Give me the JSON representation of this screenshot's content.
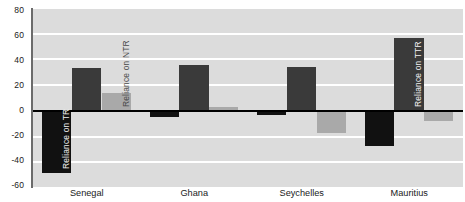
{
  "chart_data": {
    "type": "bar",
    "title": "",
    "subtitle": "",
    "xlabel": "",
    "ylabel": "",
    "categories": [
      "Senegal",
      "Ghana",
      "Seychelles",
      "Mauritius"
    ],
    "series": [
      {
        "name": "Reliance on TR",
        "color": "#111111",
        "values": [
          -48,
          -5,
          -3,
          -27
        ]
      },
      {
        "name": "Reliance on NTR",
        "color": "#3a3a3a",
        "values": [
          33,
          36,
          34,
          57
        ]
      },
      {
        "name": "Reliance on TTR",
        "color": "#a9a9a9",
        "values": [
          14,
          3,
          -17,
          -8
        ]
      }
    ],
    "ylim": [
      -60,
      80
    ],
    "yticks": [
      80,
      60,
      40,
      20,
      0,
      -20,
      -40,
      -60
    ],
    "ytick_labels": [
      "80",
      "60",
      "40",
      "20",
      "0",
      "-20",
      "-40",
      "-60"
    ],
    "grid": true,
    "grid_color": "#ffffff",
    "plot_background": "#dcdcdc",
    "zero_line_color": "#000000",
    "legend": "none",
    "annotations": [
      {
        "text": "Reliance on TR",
        "category": "Senegal",
        "series": "Reliance on TR",
        "color": "#f2f2f2"
      },
      {
        "text": "Reliance on NTR",
        "category": "Senegal",
        "series": "Reliance on TTR",
        "color": "#4a4a4a"
      },
      {
        "text": "Reliance on TTR",
        "category": "Mauritius",
        "series": "Reliance on NTR",
        "color": "#f2f2f2"
      }
    ]
  }
}
